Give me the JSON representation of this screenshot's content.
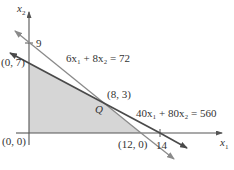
{
  "diagram": {
    "type": "linear-programming-feasible-region",
    "axes": {
      "x_label": "x",
      "x_sub": "1",
      "y_label": "x",
      "y_sub": "2"
    },
    "ticks": {
      "y_tick": "9",
      "x_tick": "14"
    },
    "vertices": [
      {
        "label": "(0, 0)",
        "x": 0,
        "y": 0
      },
      {
        "label": "(0, 7)",
        "x": 0,
        "y": 7
      },
      {
        "label": "(8, 3)",
        "x": 8,
        "y": 3
      },
      {
        "label": "(12, 0)",
        "x": 12,
        "y": 0
      }
    ],
    "constraints": [
      {
        "label": "6x₁ + 8x₂ = 72",
        "intercept_x": 12,
        "intercept_y": 9
      },
      {
        "label": "40x₁ + 80x₂ = 560",
        "intercept_x": 14,
        "intercept_y": 7
      }
    ],
    "region_label": "Q",
    "colors": {
      "region_fill": "#d6d6d6",
      "line_primary": "#4a4a4a",
      "line_secondary": "#8a8a8a",
      "axis": "#555555",
      "text": "#333333"
    }
  }
}
